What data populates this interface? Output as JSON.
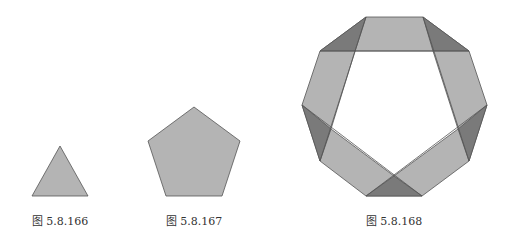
{
  "figures": [
    {
      "caption": "图 5.8.166",
      "shape": "triangle"
    },
    {
      "caption": "图 5.8.167",
      "shape": "pentagon"
    },
    {
      "caption": "图 5.8.168",
      "shape": "folded-strip-decagon"
    }
  ],
  "colors": {
    "light": "#b4b4b4",
    "dark": "#7a7a7a",
    "stroke": "#555555"
  }
}
